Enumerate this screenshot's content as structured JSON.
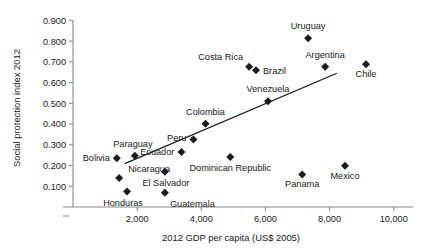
{
  "chart_data": {
    "type": "scatter",
    "title": "",
    "subtitle": "",
    "xlabel": "2012 GDP per capita (US$ 2005)",
    "ylabel": "Social protection index 2012",
    "xlim": [
      0,
      10600
    ],
    "ylim": [
      0.0,
      0.955
    ],
    "xticks": [
      2000,
      4000,
      6000,
      8000,
      10000
    ],
    "xtick_labels": [
      "2,000",
      "4,000",
      "6,000",
      "8,000",
      "10,000"
    ],
    "yticks": [
      0.1,
      0.2,
      0.3,
      0.4,
      0.5,
      0.6,
      0.7,
      0.8,
      0.9
    ],
    "ytick_labels": [
      "0.100",
      "0.200",
      "0.300",
      "0.400",
      "0.500",
      "0.600",
      "0.700",
      "0.800",
      "0.900"
    ],
    "grid": false,
    "legend": "none",
    "marker": "diamond",
    "marker_color": "#1c1c1c",
    "points": [
      {
        "label": "Uruguay",
        "x": 7330,
        "y": 0.814,
        "label_dx": 0,
        "label_dy": -9,
        "label_anchor": "middle"
      },
      {
        "label": "Argentina",
        "x": 7860,
        "y": 0.677,
        "label_dx": 0,
        "label_dy": -9,
        "label_anchor": "middle"
      },
      {
        "label": "Chile",
        "x": 9135,
        "y": 0.689,
        "label_dx": 0,
        "label_dy": 13,
        "label_anchor": "middle"
      },
      {
        "label": "Costa Rica",
        "x": 5490,
        "y": 0.677,
        "label_dx": -6,
        "label_dy": -7,
        "label_anchor": "end"
      },
      {
        "label": "Brazil",
        "x": 5705,
        "y": 0.659,
        "label_dx": 7,
        "label_dy": 4,
        "label_anchor": "start"
      },
      {
        "label": "Venezuela",
        "x": 6080,
        "y": 0.51,
        "label_dx": 0,
        "label_dy": -9,
        "label_anchor": "middle"
      },
      {
        "label": "Colombia",
        "x": 4130,
        "y": 0.402,
        "label_dx": 0,
        "label_dy": -9,
        "label_anchor": "middle"
      },
      {
        "label": "Peru",
        "x": 3755,
        "y": 0.325,
        "label_dx": -7,
        "label_dy": 1,
        "label_anchor": "end"
      },
      {
        "label": "Ecuador",
        "x": 3380,
        "y": 0.265,
        "label_dx": -7,
        "label_dy": 3,
        "label_anchor": "end"
      },
      {
        "label": "Dominican Republic",
        "x": 4905,
        "y": 0.241,
        "label_dx": 0,
        "label_dy": 14,
        "label_anchor": "middle"
      },
      {
        "label": "Mexico",
        "x": 8480,
        "y": 0.199,
        "label_dx": 0,
        "label_dy": 13,
        "label_anchor": "middle"
      },
      {
        "label": "Panama",
        "x": 7145,
        "y": 0.157,
        "label_dx": 0,
        "label_dy": 13,
        "label_anchor": "middle"
      },
      {
        "label": "Paraguay",
        "x": 1930,
        "y": 0.247,
        "label_dx": -2,
        "label_dy": -9,
        "label_anchor": "middle"
      },
      {
        "label": "El Salvador",
        "x": 2865,
        "y": 0.17,
        "label_dx": 1,
        "label_dy": 14,
        "label_anchor": "middle"
      },
      {
        "label": "Bolivia",
        "x": 1365,
        "y": 0.235,
        "label_dx": -7,
        "label_dy": 3,
        "label_anchor": "end"
      },
      {
        "label": "Nicaragua",
        "x": 1440,
        "y": 0.14,
        "label_dx": 9,
        "label_dy": -6,
        "label_anchor": "start"
      },
      {
        "label": "Honduras",
        "x": 1685,
        "y": 0.075,
        "label_dx": -4,
        "label_dy": 15,
        "label_anchor": "middle"
      },
      {
        "label": "Guatemala",
        "x": 2865,
        "y": 0.069,
        "label_dx": 5,
        "label_dy": 14,
        "label_anchor": "start"
      }
    ],
    "trend_line": {
      "x_start": 1615,
      "y_start": 0.209,
      "x_end": 8225,
      "y_end": 0.645
    }
  }
}
